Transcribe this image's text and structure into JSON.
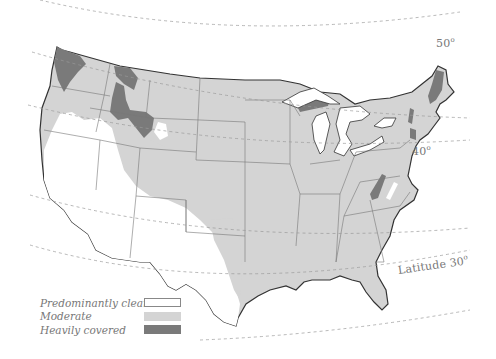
{
  "latitude_labels": [
    {
      "text": "50",
      "degree": "o",
      "x": 436,
      "y": 36
    },
    {
      "text": "40",
      "degree": "o",
      "x": 412,
      "y": 144
    },
    {
      "text": "Latitude 30",
      "degree": "o",
      "x": 398,
      "y": 263
    }
  ],
  "legend": {
    "items": [
      {
        "label": "Predominantly clear",
        "color": "#ffffff",
        "border": "#888888"
      },
      {
        "label": "Moderate",
        "color": "#d4d4d4",
        "border": "#d4d4d4"
      },
      {
        "label": "Heavily covered",
        "color": "#7a7a7a",
        "border": "#7a7a7a"
      }
    ]
  },
  "colors": {
    "clear": "#ffffff",
    "moderate": "#d4d4d4",
    "heavy": "#7a7a7a",
    "borders": "#666666",
    "coast": "#333333",
    "latitude_lines": "#999999"
  }
}
